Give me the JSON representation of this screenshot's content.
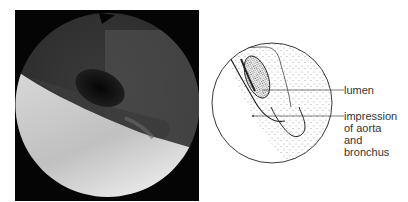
{
  "figure": {
    "photo": {
      "description": "endoscopic view (bronchoscopy) grayscale photograph"
    },
    "diagram": {
      "description": "stippled line drawing corresponding to photo",
      "labels": {
        "lumen": "lumen",
        "impression": [
          "impression",
          "of aorta",
          "and",
          "bronchus"
        ]
      }
    }
  }
}
